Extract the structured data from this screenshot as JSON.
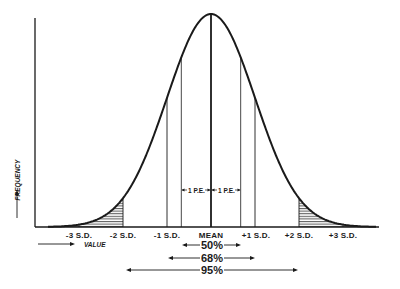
{
  "chart_data": {
    "type": "line",
    "title": "",
    "xlabel": "VALUE",
    "ylabel": "FREQUENCY",
    "x_ticks": [
      "-3 S.D.",
      "-2 S.D.",
      "-1 S.D.",
      "MEAN",
      "+1 S.D.",
      "+2 S.D.",
      "+3 S.D."
    ],
    "x_tick_sd_values": [
      -3,
      -2,
      -1,
      0,
      1,
      2,
      3
    ],
    "probable_error_markers": [
      {
        "label": "1 P.E.",
        "side": "left",
        "sd_offset": -0.6745
      },
      {
        "label": "1 P.E.",
        "side": "right",
        "sd_offset": 0.6745
      }
    ],
    "shaded_regions": [
      {
        "from_sd": -3.6,
        "to_sd": -2,
        "pattern": "horizontal-hatch"
      },
      {
        "from_sd": 2,
        "to_sd": 3.6,
        "pattern": "horizontal-hatch"
      }
    ],
    "coverage_bands": [
      {
        "label": "50%",
        "from_sd": -0.6745,
        "to_sd": 0.6745
      },
      {
        "label": "68%",
        "from_sd": -1,
        "to_sd": 1
      },
      {
        "label": "95%",
        "from_sd": -2,
        "to_sd": 2
      }
    ],
    "grid": false,
    "legend": null
  },
  "diagram": {
    "y_axis_label": "FREQUENCY",
    "x_axis_label": "VALUE",
    "tick_labels": {
      "minus3": "-3 S.D.",
      "minus2": "-2 S.D.",
      "minus1": "-1 S.D.",
      "mean": "MEAN",
      "plus1": "+1 S.D.",
      "plus2": "+2 S.D.",
      "plus3": "+3 S.D."
    },
    "ipe_left": "1 P.E.",
    "ipe_right": "1 P.E.",
    "bands": {
      "b50": "50%",
      "b68": "68%",
      "b95": "95%"
    },
    "colors": {
      "ink": "#1a1a1a",
      "background": "#ffffff"
    }
  }
}
